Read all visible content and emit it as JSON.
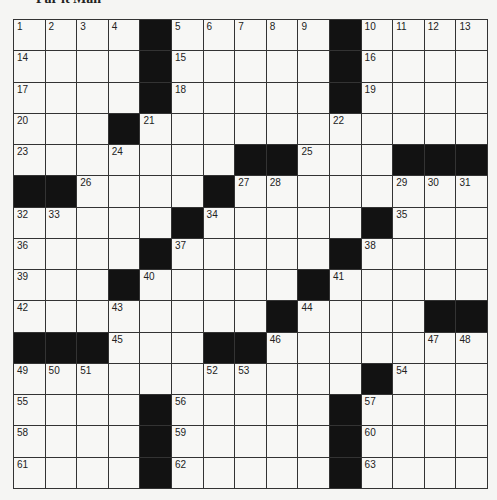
{
  "title": "Par it Man",
  "colors": {
    "black_square": "#121212",
    "white_square": "#f7f7f5",
    "grid_line": "#333333"
  },
  "grid": {
    "rows": 15,
    "cols": 15,
    "layout": [
      [
        "1",
        "2",
        "3",
        "4",
        "#",
        "5",
        "6",
        "7",
        "8",
        "9",
        "#",
        "10",
        "11",
        "12",
        "13"
      ],
      [
        "14",
        "",
        "",
        "",
        "#",
        "15",
        "",
        "",
        "",
        "",
        "#",
        "16",
        "",
        "",
        ""
      ],
      [
        "17",
        "",
        "",
        "",
        "#",
        "18",
        "",
        "",
        "",
        "",
        "#",
        "19",
        "",
        "",
        ""
      ],
      [
        "20",
        "",
        "",
        "#",
        "21",
        "",
        "",
        "",
        "",
        "",
        "22",
        "",
        "",
        "",
        ""
      ],
      [
        "23",
        "",
        "",
        "24",
        "",
        "",
        "",
        "#",
        "#",
        "25",
        "",
        "",
        "#",
        "#",
        "#"
      ],
      [
        "#",
        "#",
        "26",
        "",
        "",
        "",
        "#",
        "27",
        "28",
        "",
        "",
        "",
        "29",
        "30",
        "31"
      ],
      [
        "32",
        "33",
        "",
        "",
        "",
        "#",
        "34",
        "",
        "",
        "",
        "",
        "#",
        "35",
        "",
        ""
      ],
      [
        "36",
        "",
        "",
        "",
        "#",
        "37",
        "",
        "",
        "",
        "",
        "#",
        "38",
        "",
        "",
        ""
      ],
      [
        "39",
        "",
        "",
        "#",
        "40",
        "",
        "",
        "",
        "",
        "#",
        "41",
        "",
        "",
        "",
        ""
      ],
      [
        "42",
        "",
        "",
        "43",
        "",
        "",
        "",
        "",
        "#",
        "44",
        "",
        "",
        "",
        "#",
        "#"
      ],
      [
        "#",
        "#",
        "#",
        "45",
        "",
        "",
        "#",
        "#",
        "46",
        "",
        "",
        "",
        "",
        "47",
        "48"
      ],
      [
        "49",
        "50",
        "51",
        "",
        "",
        "",
        "52",
        "53",
        "",
        "",
        "",
        "#",
        "54",
        "",
        ""
      ],
      [
        "55",
        "",
        "",
        "",
        "#",
        "56",
        "",
        "",
        "",
        "",
        "#",
        "57",
        "",
        "",
        ""
      ],
      [
        "58",
        "",
        "",
        "",
        "#",
        "59",
        "",
        "",
        "",
        "",
        "#",
        "60",
        "",
        "",
        ""
      ],
      [
        "61",
        "",
        "",
        "",
        "#",
        "62",
        "",
        "",
        "",
        "",
        "#",
        "63",
        "",
        "",
        ""
      ]
    ]
  }
}
